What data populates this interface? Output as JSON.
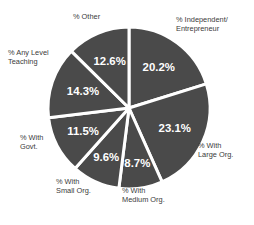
{
  "chart_data": {
    "type": "pie",
    "title": "",
    "xlabel": "",
    "ylabel": "",
    "legend_position": "outside-labels",
    "grid": false,
    "categories": [
      "% Independent/\nEntrepreneur",
      "% With\nLarge Org.",
      "% With\nMedium Org.",
      "% With\nSmall Org.",
      "% With\nGovt.",
      "% Any Level\nTeaching",
      "% Other"
    ],
    "values": [
      20.2,
      23.1,
      8.7,
      9.6,
      11.5,
      14.3,
      12.6
    ],
    "value_labels": [
      "20.2%",
      "23.1%",
      "8.7%",
      "9.6%",
      "11.5%",
      "14.3%",
      "12.6%"
    ],
    "slice_color": "#4a4a4a",
    "separator_color": "#ffffff",
    "value_text_color": "#ffffff",
    "label_text_color": "#3a3a3a",
    "background_color": "#ffffff"
  },
  "labels": {
    "other": "% Other",
    "independent": "% Independent/\nEntrepreneur",
    "teaching": "% Any Level\nTeaching",
    "govt": "% With\nGovt.",
    "small": "% With\nSmall Org.",
    "medium": "% With\nMedium Org.",
    "large": "% With\nLarge Org."
  },
  "values": {
    "independent": "20.2%",
    "large": "23.1%",
    "medium": "8.7%",
    "small": "9.6%",
    "govt": "11.5%",
    "teaching": "14.3%",
    "other": "12.6%"
  }
}
